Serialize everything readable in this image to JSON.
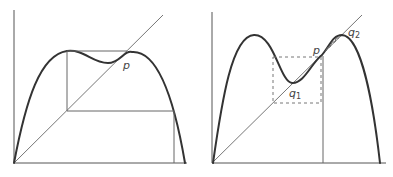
{
  "figure": {
    "panels": [
      {
        "id": "left",
        "labels": {
          "p": "p"
        },
        "description": "Bimodal map with single fixed point p; cobweb orbit"
      },
      {
        "id": "right",
        "labels": {
          "p": "p",
          "q1": "q",
          "q1_sub": "1",
          "q2": "q",
          "q2_sub": "2"
        },
        "description": "Bimodal map with fixed points q1, p, q2; dashed box and cobweb near p"
      }
    ],
    "colors": {
      "curve": "#333333",
      "axis": "#555555",
      "line": "#666666",
      "dashed": "#777777"
    }
  }
}
